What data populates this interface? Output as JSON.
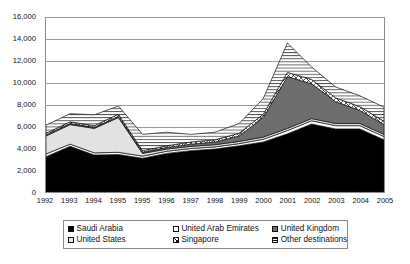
{
  "chart_data": {
    "type": "area",
    "stacked": true,
    "title": "",
    "subtitle": "",
    "xlabel": "",
    "ylabel": "",
    "ylim": [
      0,
      16000
    ],
    "ytick_step": 2000,
    "ytick_labels": [
      "16,000",
      "14,000",
      "12,000",
      "10,000",
      "8,000",
      "6,000",
      "4,000",
      "2,000",
      "0"
    ],
    "ytick_values": [
      16000,
      14000,
      12000,
      10000,
      8000,
      6000,
      4000,
      2000,
      0
    ],
    "grid": "horizontal",
    "legend_position": "bottom",
    "categories": [
      "1992",
      "1993",
      "1994",
      "1995",
      "1995",
      "1996",
      "1997",
      "1998",
      "1999",
      "2000",
      "2001",
      "2002",
      "2003",
      "2004",
      "2005"
    ],
    "series": [
      {
        "name": "Saudi Arabia",
        "fill": "black",
        "color": "#000000",
        "values": [
          3250,
          4200,
          3400,
          3450,
          3100,
          3550,
          3800,
          3950,
          4250,
          4600,
          5350,
          6250,
          5800,
          5800,
          4800
        ]
      },
      {
        "name": "United Arab Emirates",
        "fill": "white",
        "color": "#ffffff",
        "values": [
          250,
          200,
          200,
          200,
          200,
          200,
          200,
          200,
          200,
          250,
          300,
          300,
          300,
          300,
          300
        ]
      },
      {
        "name": "United States",
        "fill": "light-gray",
        "color": "#e2e2e2",
        "values": [
          1650,
          1800,
          2250,
          3200,
          250,
          200,
          200,
          200,
          200,
          200,
          200,
          200,
          200,
          200,
          200
        ]
      },
      {
        "name": "United Kingdom",
        "fill": "dark-gray",
        "color": "#6e6e6e",
        "values": [
          100,
          100,
          100,
          100,
          100,
          150,
          200,
          250,
          500,
          1800,
          4750,
          3200,
          2000,
          1200,
          900
        ]
      },
      {
        "name": "Singapore",
        "fill": "cross-hatch",
        "color": "#ffffff",
        "values": [
          150,
          150,
          150,
          200,
          150,
          150,
          200,
          200,
          250,
          300,
          400,
          400,
          350,
          350,
          300
        ]
      },
      {
        "name": "Other destinations",
        "fill": "horizontal-lines",
        "color": "#ffffff",
        "values": [
          750,
          750,
          1000,
          750,
          1500,
          1250,
          700,
          700,
          900,
          1450,
          2700,
          1150,
          1000,
          1000,
          1300
        ]
      }
    ],
    "totals": [
      6150,
      7200,
      7100,
      7900,
      5300,
      5500,
      5300,
      5500,
      6300,
      8600,
      13700,
      11500,
      9650,
      8850,
      7800
    ]
  },
  "legend": {
    "items": [
      {
        "label": "Saudi Arabia",
        "swatch": "sw-black"
      },
      {
        "label": "United Arab Emirates",
        "swatch": "sw-white"
      },
      {
        "label": "United Kingdom",
        "swatch": "sw-dkgray"
      },
      {
        "label": "United States",
        "swatch": "sw-ltgray"
      },
      {
        "label": "Singapore",
        "swatch": "sw-cross"
      },
      {
        "label": "Other destinations",
        "swatch": "sw-hline"
      }
    ]
  }
}
